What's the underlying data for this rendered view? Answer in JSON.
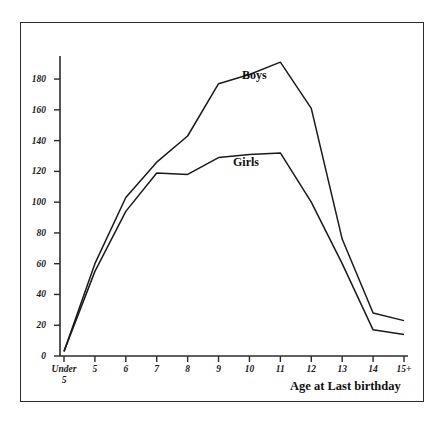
{
  "chart_data": {
    "type": "line",
    "title": "",
    "subtitle": "",
    "xlabel": "Age at Last birthday",
    "ylabel": "",
    "categories": [
      "Under 5",
      "5",
      "6",
      "7",
      "8",
      "9",
      "10",
      "11",
      "12",
      "13",
      "14",
      "15+"
    ],
    "x_tick_labels": [
      "Under 5",
      "5",
      "6",
      "7",
      "8",
      "9",
      "10",
      "11",
      "12",
      "13",
      "14",
      "15+"
    ],
    "y_tick_labels": [
      "0",
      "20",
      "40",
      "60",
      "80",
      "100",
      "120",
      "140",
      "160",
      "180"
    ],
    "y_ticks": [
      0,
      20,
      40,
      60,
      80,
      100,
      120,
      140,
      160,
      180
    ],
    "ylim": [
      0,
      195
    ],
    "grid": false,
    "legend_position": "inline-annotation",
    "series": [
      {
        "name": "Boys",
        "values": [
          3,
          60,
          103,
          126,
          143,
          177,
          183,
          191,
          161,
          76,
          28,
          23
        ],
        "color": "#1a1a1a",
        "annotation": "Boys"
      },
      {
        "name": "Girls",
        "values": [
          3,
          55,
          94,
          119,
          118,
          129,
          131,
          132,
          100,
          60,
          17,
          14
        ],
        "color": "#1a1a1a",
        "annotation": "Girls"
      }
    ],
    "annotations": [
      {
        "text": "Boys",
        "x_category": "9",
        "value": 170
      },
      {
        "text": "Girls",
        "x_category": "9",
        "value": 120
      }
    ]
  },
  "axis": {
    "x_title": "Age at Last birthday",
    "under_five_line1": "Under",
    "under_five_line2": "5"
  }
}
